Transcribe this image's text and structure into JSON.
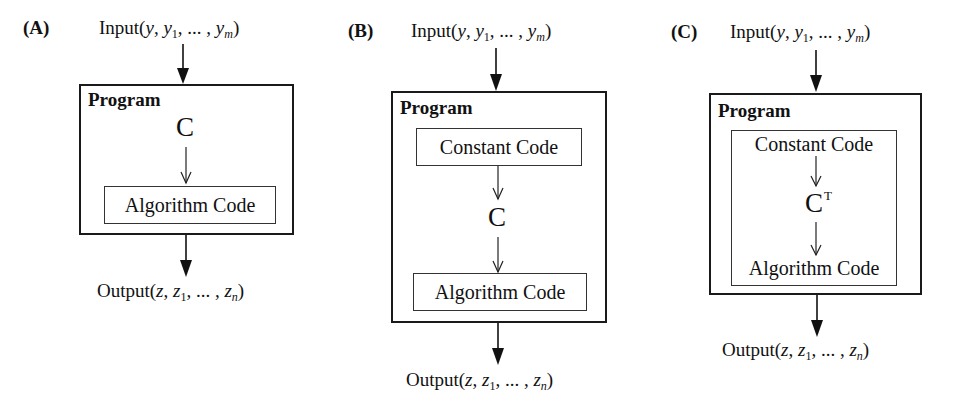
{
  "figure": {
    "panels": [
      {
        "label": "(A)",
        "input": {
          "prefix": "Input(",
          "v0": "y",
          "sep1": ", ",
          "v1": "y",
          "v1_sub": "1",
          "mid": ", ... , ",
          "vm": "y",
          "vm_sub": "m",
          "suffix": ")"
        },
        "program_title": "Program",
        "constant_code": null,
        "constant_symbol": "C",
        "constant_sup": "",
        "algorithm_code": "Algorithm Code",
        "output": {
          "prefix": "Output(",
          "v0": "z",
          "sep1": ", ",
          "v1": "z",
          "v1_sub": "1",
          "mid": ", ... , ",
          "vn": "z",
          "vn_sub": "n",
          "suffix": ")"
        }
      },
      {
        "label": "(B)",
        "input": {
          "prefix": "Input(",
          "v0": "y",
          "sep1": ", ",
          "v1": "y",
          "v1_sub": "1",
          "mid": ", ... , ",
          "vm": "y",
          "vm_sub": "m",
          "suffix": ")"
        },
        "program_title": "Program",
        "constant_code": "Constant Code",
        "constant_symbol": "C",
        "constant_sup": "",
        "algorithm_code": "Algorithm Code",
        "output": {
          "prefix": "Output(",
          "v0": "z",
          "sep1": ", ",
          "v1": "z",
          "v1_sub": "1",
          "mid": ", ... , ",
          "vn": "z",
          "vn_sub": "n",
          "suffix": ")"
        }
      },
      {
        "label": "(C)",
        "input": {
          "prefix": "Input(",
          "v0": "y",
          "sep1": ", ",
          "v1": "y",
          "v1_sub": "1",
          "mid": ", ... , ",
          "vm": "y",
          "vm_sub": "m",
          "suffix": ")"
        },
        "program_title": "Program",
        "constant_code": "Constant Code",
        "constant_symbol": "C",
        "constant_sup": "T",
        "algorithm_code": "Algorithm Code",
        "output": {
          "prefix": "Output(",
          "v0": "z",
          "sep1": ", ",
          "v1": "z",
          "v1_sub": "1",
          "mid": ", ... , ",
          "vn": "z",
          "vn_sub": "n",
          "suffix": ")"
        }
      }
    ]
  }
}
